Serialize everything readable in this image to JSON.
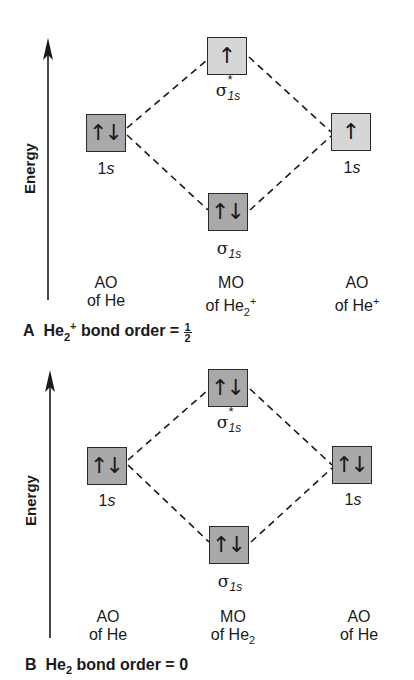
{
  "panels": [
    {
      "id": "A",
      "axis_label": "Energy",
      "orbitals": {
        "left_ao": {
          "electrons": "↑↓",
          "label_num": "1",
          "label_sub": "s",
          "shade": "dark"
        },
        "sigma_star": {
          "electrons": "↑",
          "label_sym": "σ",
          "label_sup": "*",
          "label_sub": "1s",
          "shade": "light"
        },
        "sigma": {
          "electrons": "↑↓",
          "label_sym": "σ",
          "label_sub": "1s",
          "shade": "dark"
        },
        "right_ao": {
          "electrons": "↑",
          "label_num": "1",
          "label_sub": "s",
          "shade": "light"
        }
      },
      "columns": {
        "left": {
          "line1": "AO",
          "line2": "of He",
          "sub": "",
          "sup": ""
        },
        "center": {
          "line1": "MO",
          "line2": "of He",
          "sub": "2",
          "sup": "+"
        },
        "right": {
          "line1": "AO",
          "line2": "of He",
          "sub": "",
          "sup": "+"
        }
      },
      "caption": {
        "letter": "A",
        "species": "He",
        "sub": "2",
        "sup": "+",
        "text": "bond order =",
        "value_num": "1",
        "value_den": "2"
      }
    },
    {
      "id": "B",
      "axis_label": "Energy",
      "orbitals": {
        "left_ao": {
          "electrons": "↑↓",
          "label_num": "1",
          "label_sub": "s",
          "shade": "dark"
        },
        "sigma_star": {
          "electrons": "↑↓",
          "label_sym": "σ",
          "label_sup": "*",
          "label_sub": "1s",
          "shade": "dark"
        },
        "sigma": {
          "electrons": "↑↓",
          "label_sym": "σ",
          "label_sub": "1s",
          "shade": "dark"
        },
        "right_ao": {
          "electrons": "↑↓",
          "label_num": "1",
          "label_sub": "s",
          "shade": "dark"
        }
      },
      "columns": {
        "left": {
          "line1": "AO",
          "line2": "of He",
          "sub": "",
          "sup": ""
        },
        "center": {
          "line1": "MO",
          "line2": "of He",
          "sub": "2",
          "sup": ""
        },
        "right": {
          "line1": "AO",
          "line2": "of He",
          "sub": "",
          "sup": ""
        }
      },
      "caption": {
        "letter": "B",
        "species": "He",
        "sub": "2",
        "sup": "",
        "text": "bond order =",
        "value": "0"
      }
    }
  ],
  "colors": {
    "dark_box": "#a9a9a9",
    "light_box": "#d6d6d6",
    "line": "#1a1a1a"
  }
}
